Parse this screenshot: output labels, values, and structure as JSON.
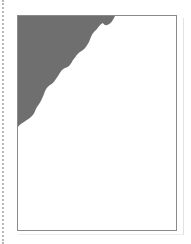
{
  "view": {
    "type": "page-thumbnail",
    "page": {
      "background": "#ffffff",
      "border_color": "#8a8a8a"
    },
    "shaded_region": {
      "fill": "#6f6f6f",
      "shape": "wavy-diagonal-top-left-corner"
    },
    "guide": {
      "style": "dotted",
      "color": "#b8b8b8"
    }
  }
}
